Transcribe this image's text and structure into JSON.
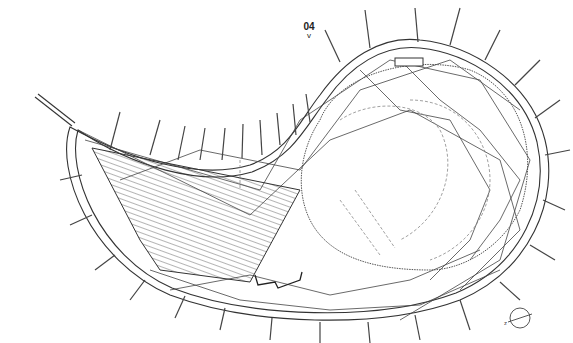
{
  "drawing": {
    "section_label": "04",
    "section_marker": "v",
    "north_arrow_label": "N",
    "colors": {
      "line": "#333333",
      "hatch": "#444444",
      "dashed": "#777777"
    }
  }
}
